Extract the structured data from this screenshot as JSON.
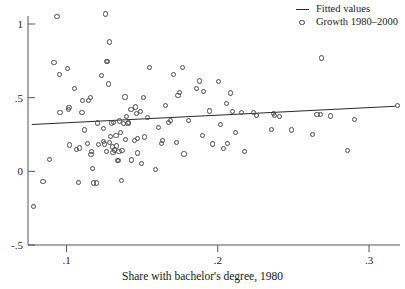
{
  "chart_data": {
    "type": "scatter",
    "title": "",
    "subtitle": "",
    "xlabel": "Share with bachelor's degree, 1980",
    "ylabel": "",
    "xlim": [
      0.0745,
      0.3205
    ],
    "ylim": [
      -0.5,
      1.12
    ],
    "grid": false,
    "legend_position": "top-right",
    "xticks": [
      0.1,
      0.2,
      0.3
    ],
    "xticklabels": [
      ".1",
      ".2",
      ".3"
    ],
    "yticks": [
      -0.5,
      0,
      0.5,
      1
    ],
    "yticklabels": [
      "-.5",
      "0",
      ".5",
      "1"
    ],
    "legend": [
      {
        "label": "Fitted values",
        "marker": "line"
      },
      {
        "label": "Growth 1980–2000",
        "marker": "circle"
      }
    ],
    "series": [
      {
        "name": "Growth 1980–2000",
        "type": "scatter",
        "marker": "open-circle",
        "color": "#4a4a4a",
        "points": [
          [
            0.0773,
            -0.232
          ],
          [
            0.0838,
            -0.061
          ],
          [
            0.088,
            0.087
          ],
          [
            0.091,
            0.744
          ],
          [
            0.093,
            1.055
          ],
          [
            0.0945,
            0.666
          ],
          [
            0.095,
            0.406
          ],
          [
            0.1,
            0.705
          ],
          [
            0.1005,
            0.428
          ],
          [
            0.101,
            0.438
          ],
          [
            0.1015,
            0.185
          ],
          [
            0.1045,
            0.569
          ],
          [
            0.106,
            0.157
          ],
          [
            0.1075,
            -0.069
          ],
          [
            0.108,
            0.165
          ],
          [
            0.1095,
            0.406
          ],
          [
            0.11,
            0.485
          ],
          [
            0.111,
            0.287
          ],
          [
            0.113,
            0.194
          ],
          [
            0.114,
            0.488
          ],
          [
            0.115,
            0.506
          ],
          [
            0.1155,
            0.122
          ],
          [
            0.116,
            0.14
          ],
          [
            0.1165,
            0.028
          ],
          [
            0.117,
            -0.073
          ],
          [
            0.119,
            -0.073
          ],
          [
            0.12,
            0.335
          ],
          [
            0.1205,
            0.191
          ],
          [
            0.1225,
            0.659
          ],
          [
            0.1235,
            0.209
          ],
          [
            0.124,
            0.296
          ],
          [
            0.1245,
            0.192
          ],
          [
            0.125,
            1.075
          ],
          [
            0.1255,
            0.139
          ],
          [
            0.126,
            0.754
          ],
          [
            0.1265,
            0.75
          ],
          [
            0.127,
            0.6
          ],
          [
            0.1275,
            0.884
          ],
          [
            0.128,
            0.204
          ],
          [
            0.1285,
            0.243
          ],
          [
            0.129,
            0.335
          ],
          [
            0.1295,
            0.172
          ],
          [
            0.13,
            0.137
          ],
          [
            0.1305,
            0.34
          ],
          [
            0.131,
            0.152
          ],
          [
            0.132,
            0.249
          ],
          [
            0.1325,
            0.179
          ],
          [
            0.133,
            0.08
          ],
          [
            0.1335,
            0.078
          ],
          [
            0.134,
            0.143
          ],
          [
            0.1345,
            0.348
          ],
          [
            0.135,
            0.268
          ],
          [
            0.1355,
            -0.055
          ],
          [
            0.136,
            0.15
          ],
          [
            0.137,
            0.33
          ],
          [
            0.138,
            0.511
          ],
          [
            0.1385,
            0.222
          ],
          [
            0.139,
            0.38
          ],
          [
            0.14,
            0.333
          ],
          [
            0.1405,
            0.336
          ],
          [
            0.142,
            0.424
          ],
          [
            0.1425,
            0.084
          ],
          [
            0.144,
            0.216
          ],
          [
            0.145,
            0.443
          ],
          [
            0.1455,
            0.4
          ],
          [
            0.146,
            0.229
          ],
          [
            0.1465,
            0.131
          ],
          [
            0.148,
            0.411
          ],
          [
            0.149,
            0.06
          ],
          [
            0.15,
            0.509
          ],
          [
            0.151,
            0.24
          ],
          [
            0.153,
            0.374
          ],
          [
            0.154,
            0.712
          ],
          [
            0.158,
            0.019
          ],
          [
            0.16,
            0.302
          ],
          [
            0.162,
            0.196
          ],
          [
            0.163,
            0.218
          ],
          [
            0.165,
            0.451
          ],
          [
            0.167,
            0.338
          ],
          [
            0.168,
            0.352
          ],
          [
            0.17,
            0.664
          ],
          [
            0.172,
            0.203
          ],
          [
            0.173,
            0.524
          ],
          [
            0.174,
            0.544
          ],
          [
            0.176,
            0.712
          ],
          [
            0.177,
            0.125
          ],
          [
            0.18,
            0.354
          ],
          [
            0.185,
            0.571
          ],
          [
            0.187,
            0.62
          ],
          [
            0.189,
            0.252
          ],
          [
            0.19,
            0.546
          ],
          [
            0.194,
            0.416
          ],
          [
            0.196,
            0.192
          ],
          [
            0.2,
            0.616
          ],
          [
            0.201,
            0.323
          ],
          [
            0.203,
            0.163
          ],
          [
            0.205,
            0.465
          ],
          [
            0.206,
            0.198
          ],
          [
            0.208,
            0.539
          ],
          [
            0.209,
            0.411
          ],
          [
            0.211,
            0.273
          ],
          [
            0.215,
            0.408
          ],
          [
            0.217,
            0.141
          ],
          [
            0.223,
            0.407
          ],
          [
            0.225,
            0.383
          ],
          [
            0.235,
            0.29
          ],
          [
            0.236,
            0.4
          ],
          [
            0.237,
            0.384
          ],
          [
            0.24,
            0.38
          ],
          [
            0.248,
            0.287
          ],
          [
            0.262,
            0.259
          ],
          [
            0.265,
            0.392
          ],
          [
            0.267,
            0.39
          ],
          [
            0.268,
            0.776
          ],
          [
            0.274,
            0.382
          ],
          [
            0.285,
            0.149
          ],
          [
            0.29,
            0.36
          ],
          [
            0.318,
            0.452
          ]
        ]
      },
      {
        "name": "Fitted values",
        "type": "line",
        "color": "#2a2a2a",
        "points": [
          [
            0.077,
            0.318
          ],
          [
            0.3175,
            0.442
          ]
        ]
      }
    ]
  },
  "axes": {
    "x_axis_title": "Share with bachelor's degree, 1980",
    "y_axis_title": ""
  }
}
